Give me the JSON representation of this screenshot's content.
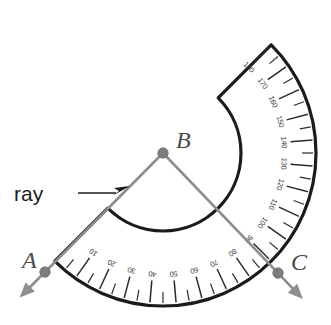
{
  "figure": {
    "type": "geometry-diagram",
    "background_color": "#ffffff"
  },
  "annotation": {
    "ray_label": "ray"
  },
  "points": [
    {
      "id": "A",
      "label": "A",
      "x": 45,
      "y": 272,
      "label_x": 22,
      "label_y": 268
    },
    {
      "id": "B",
      "label": "B",
      "x": 163,
      "y": 153,
      "label_x": 176,
      "label_y": 148
    },
    {
      "id": "C",
      "label": "C",
      "x": 278,
      "y": 273,
      "label_x": 291,
      "label_y": 270
    }
  ],
  "protractor": {
    "center_x": 163,
    "center_y": 153,
    "outer_radius": 153,
    "inner_radius": 78,
    "rotation_degrees": -45,
    "scale_min": 0,
    "scale_max": 180,
    "major_step": 10,
    "minor_step": 5,
    "tick_labels": [
      "10",
      "20",
      "30",
      "40",
      "50",
      "60",
      "70",
      "80",
      "90",
      "100",
      "110",
      "120",
      "130",
      "140",
      "150",
      "160",
      "170",
      "180"
    ],
    "outline_color": "#1b1b1b",
    "fill_color": "#ffffff",
    "tick_color": "#2a2a2a"
  },
  "rays": [
    {
      "id": "ray-BA",
      "from": "B",
      "through": "A",
      "has_arrowhead": true,
      "color": "#8e8e8e",
      "annotated": true
    },
    {
      "id": "ray-BC",
      "from": "B",
      "through": "C",
      "has_arrowhead": true,
      "color": "#8e8e8e",
      "annotated": false
    }
  ],
  "colors": {
    "ink": "#1b1b1b",
    "ray_gray": "#8e8e8e",
    "dot_gray": "#7d7d7d",
    "label_gray": "#4a4a4a",
    "tick_gray": "#2a2a2a"
  }
}
